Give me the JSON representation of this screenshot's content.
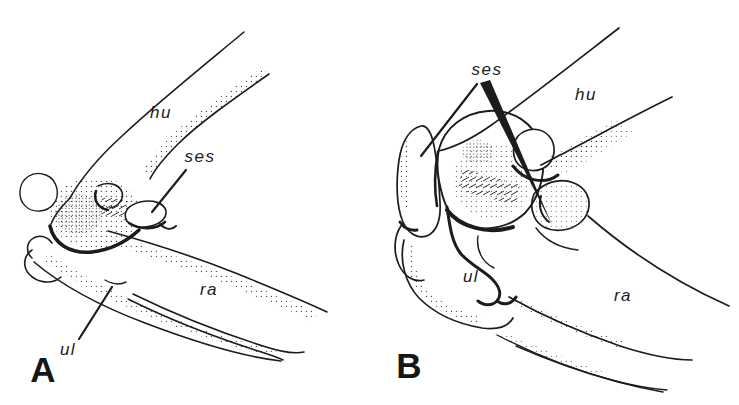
{
  "figure": {
    "background_color": "#ffffff",
    "ink_color": "#1c1c1c",
    "panels": [
      {
        "letter": "A",
        "labels": {
          "humerus": "hu",
          "sesamoid": "ses",
          "radius": "ra",
          "ulna": "ul"
        }
      },
      {
        "letter": "B",
        "labels": {
          "sesamoid": "ses",
          "humerus": "hu",
          "ulna": "ul",
          "radius": "ra"
        }
      }
    ]
  }
}
